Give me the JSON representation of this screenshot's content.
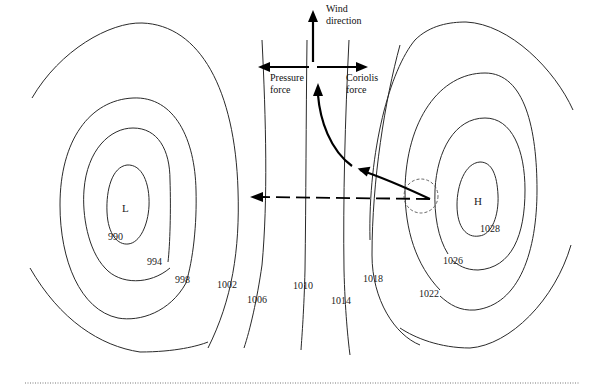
{
  "diagram": {
    "low_center": {
      "label": "L",
      "x": 126,
      "y": 209
    },
    "high_center": {
      "label": "H",
      "x": 478,
      "y": 202
    },
    "isobars_low": [
      {
        "value": "990",
        "label_x": 115,
        "label_y": 242
      },
      {
        "value": "994",
        "label_x": 147,
        "label_y": 266
      },
      {
        "value": "998",
        "label_x": 175,
        "label_y": 283
      },
      {
        "value": "1002",
        "label_x": 217,
        "label_y": 288
      }
    ],
    "isobars_straight": [
      {
        "value": "1006",
        "label_x": 247,
        "label_y": 303
      },
      {
        "value": "1010",
        "label_x": 293,
        "label_y": 288
      },
      {
        "value": "1014",
        "label_x": 331,
        "label_y": 304
      },
      {
        "value": "1018",
        "label_x": 364,
        "label_y": 280
      }
    ],
    "isobars_high": [
      {
        "value": "1022",
        "label_x": 420,
        "label_y": 298
      },
      {
        "value": "1026",
        "label_x": 443,
        "label_y": 264
      },
      {
        "value": "1028",
        "label_x": 481,
        "label_y": 233
      }
    ],
    "forces": {
      "wind_direction": {
        "line1": "Wind",
        "line2": "direction"
      },
      "pressure_force": {
        "line1": "Pressure",
        "line2": "force"
      },
      "coriolis_force": {
        "line1": "Coriolis",
        "line2": "force"
      }
    },
    "colors": {
      "isobar": "#2a2a2a",
      "arrow": "#000000",
      "background": "#ffffff"
    }
  }
}
